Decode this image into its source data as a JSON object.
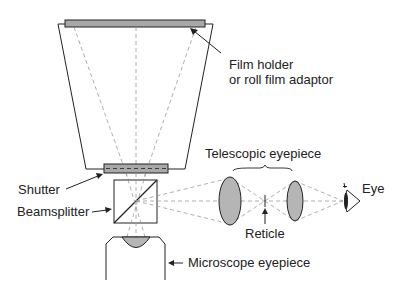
{
  "diagram": {
    "type": "optical schematic",
    "labels": {
      "film_holder_line1": "Film holder",
      "film_holder_line2": "or roll film adaptor",
      "telescopic_eyepiece": "Telescopic eyepiece",
      "shutter": "Shutter",
      "beamsplitter": "Beamsplitter",
      "reticle": "Reticle",
      "eye": "Eye",
      "microscope_eyepiece": "Microscope eyepiece"
    },
    "colors": {
      "line": "#222222",
      "ray": "#999999",
      "fill": "#b5b5b5",
      "background": "#ffffff"
    }
  }
}
